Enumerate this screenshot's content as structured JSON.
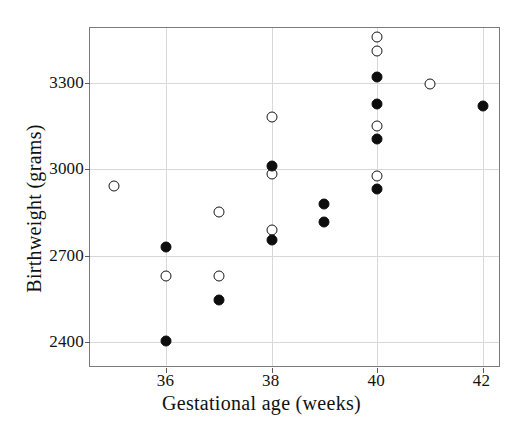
{
  "chart_data": {
    "type": "scatter",
    "title": "",
    "xlabel": "Gestational age (weeks)",
    "ylabel": "Birthweight (grams)",
    "xlim": [
      34.55,
      42.35
    ],
    "ylim": [
      2310,
      3490
    ],
    "xticks": [
      36,
      38,
      40,
      42
    ],
    "xtick_labels": [
      "36",
      "38",
      "40",
      "42"
    ],
    "yticks": [
      2400,
      2700,
      3000,
      3300
    ],
    "ytick_labels": [
      "2400",
      "2700",
      "3000",
      "3300"
    ],
    "grid": true,
    "legend": "none",
    "series": [
      {
        "name": "open",
        "marker": "open-circle",
        "color": "#161616",
        "fill": "#ffffff",
        "points": [
          {
            "x": 35,
            "y": 2940
          },
          {
            "x": 36,
            "y": 2630
          },
          {
            "x": 37,
            "y": 2850
          },
          {
            "x": 37,
            "y": 2630
          },
          {
            "x": 38,
            "y": 3180
          },
          {
            "x": 38,
            "y": 2985
          },
          {
            "x": 38,
            "y": 2790
          },
          {
            "x": 40,
            "y": 3460
          },
          {
            "x": 40,
            "y": 3410
          },
          {
            "x": 40,
            "y": 3150
          },
          {
            "x": 40,
            "y": 2975
          },
          {
            "x": 41,
            "y": 3295
          }
        ]
      },
      {
        "name": "filled",
        "marker": "filled-circle",
        "color": "#0d0d0d",
        "fill": "#0d0d0d",
        "points": [
          {
            "x": 36,
            "y": 2730
          },
          {
            "x": 36,
            "y": 2405
          },
          {
            "x": 37,
            "y": 2545
          },
          {
            "x": 38,
            "y": 3010
          },
          {
            "x": 38,
            "y": 2755
          },
          {
            "x": 39,
            "y": 2880
          },
          {
            "x": 39,
            "y": 2815
          },
          {
            "x": 40,
            "y": 3320
          },
          {
            "x": 40,
            "y": 3225
          },
          {
            "x": 40,
            "y": 3105
          },
          {
            "x": 40,
            "y": 2930
          },
          {
            "x": 42,
            "y": 3220
          }
        ]
      }
    ]
  }
}
